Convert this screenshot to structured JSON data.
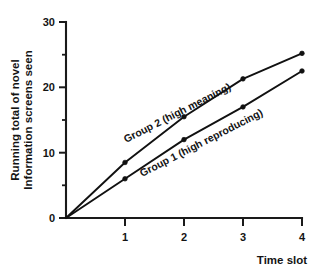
{
  "chart_data": {
    "type": "line",
    "title": "",
    "xlabel": "Time slot",
    "ylabel": "Running total of novel Information screens seen",
    "ylabel_lines": [
      "Running total of novel",
      "Information screens seen"
    ],
    "x": [
      0,
      1,
      2,
      3,
      4
    ],
    "xlim": [
      0,
      4
    ],
    "ylim": [
      0,
      30
    ],
    "xticks": [
      "1",
      "2",
      "3",
      "4"
    ],
    "xtick_values": [
      1,
      2,
      3,
      4
    ],
    "yticks": [
      "0",
      "10",
      "20",
      "30"
    ],
    "ytick_values": [
      0,
      10,
      20,
      30
    ],
    "yticks_minor": [
      5,
      15,
      25
    ],
    "grid": false,
    "legend_position": "inline-annotations",
    "marker": "filled-circle",
    "series": [
      {
        "name": "Group 2 (high meaning)",
        "label": "Group 2 (high meaning)",
        "values": [
          0,
          8.5,
          15.5,
          21.3,
          25.2
        ]
      },
      {
        "name": "Group 1 (high reproducing)",
        "label": "Group 1 (high reproducing)",
        "values": [
          0,
          6.0,
          12.0,
          17.0,
          22.5
        ]
      }
    ],
    "annotations": [
      {
        "text": "Group 2 (high meaning)",
        "x": 1.35,
        "y": 14.2,
        "rotation": -27
      },
      {
        "text": "Group 1 (high reproducing)",
        "x": 1.95,
        "y": 10.6,
        "rotation": -27
      }
    ],
    "colors": {
      "line": "#111111",
      "axis": "#1a1a1a",
      "background": "#ffffff",
      "text": "#141414"
    }
  }
}
